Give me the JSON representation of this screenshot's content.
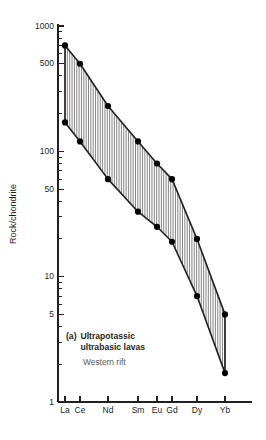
{
  "chart_data": {
    "type": "area",
    "title": "",
    "xlabel": "",
    "ylabel": "Rock/chondrite",
    "yscale": "log",
    "ylim": [
      1,
      1000
    ],
    "grid": false,
    "legend_position": "none",
    "categories": [
      "La",
      "Ce",
      "Nd",
      "Sm",
      "Eu",
      "Gd",
      "Dy",
      "Yb"
    ],
    "ytick_labels": [
      "1000",
      "500",
      "100",
      "50",
      "10",
      "5",
      "1"
    ],
    "ytick_values": [
      1000,
      500,
      100,
      50,
      10,
      5,
      1
    ],
    "series": [
      {
        "name": "upper bound",
        "values": [
          700,
          500,
          230,
          120,
          80,
          60,
          20,
          5
        ]
      },
      {
        "name": "lower bound",
        "values": [
          170,
          120,
          60,
          33,
          25,
          19,
          7,
          1.7
        ]
      }
    ],
    "annotations": {
      "panel_tag": "(a)",
      "line1": "Ultrapotassic",
      "line2": "ultrabasic lavas",
      "line3": "Western rift"
    }
  },
  "axis": {
    "y_title": "Rock/chondrite"
  }
}
